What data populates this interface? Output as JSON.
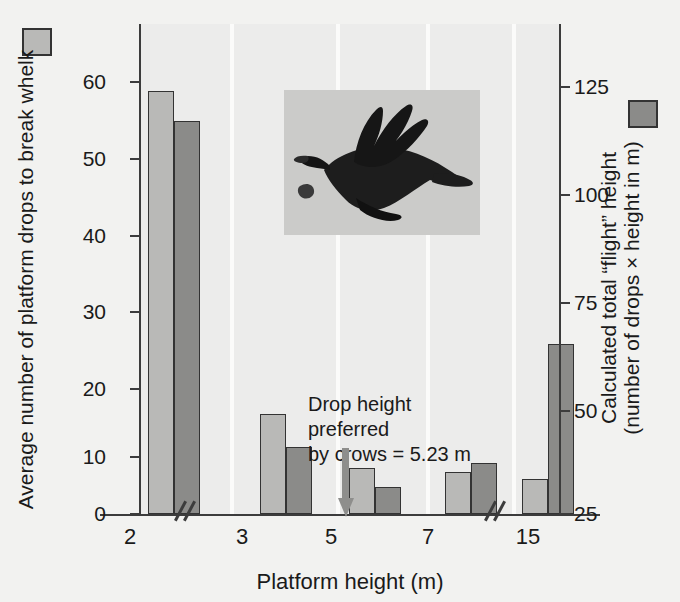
{
  "chart_data": {
    "type": "bar",
    "title": "",
    "xlabel": "Platform height (m)",
    "categories": [
      "2",
      "3",
      "5",
      "7",
      "15"
    ],
    "series": [
      {
        "name": "Average number of platform drops to break whelk",
        "axis": "left",
        "color": "#b9b9b7",
        "values": [
          55,
          13,
          6,
          5.4,
          4.5
        ]
      },
      {
        "name": "Calculated total “flight” height (number of drops × height in m)",
        "axis": "right",
        "color": "#8b8b89",
        "values": [
          51,
          8.7,
          3.5,
          6.6,
          22
        ]
      }
    ],
    "left_axis": {
      "label": "Average number of platform drops to break whelk",
      "ticks": [
        "0",
        "10",
        "20",
        "30",
        "40",
        "50",
        "60"
      ],
      "ylim": [
        0,
        64
      ]
    },
    "right_axis": {
      "label": "Calculated total “flight” height (number of drops × height in m)",
      "ticks": [
        "25",
        "50",
        "75",
        "100",
        "125"
      ],
      "ylim": [
        25,
        133
      ]
    },
    "annotation": "Drop height preferred by crows = 5.23 m",
    "annotation_lines": [
      "Drop height",
      "preferred",
      "by crows = 5.23 m"
    ],
    "axis_breaks": 2,
    "grid": false,
    "legend_position": "axis-labels"
  },
  "axes": {
    "x_title": "Platform height (m)",
    "left_title": "Average number of platform drops to break whelk",
    "right_title_line1": "Calculated total “flight” height",
    "right_title_line2": "(number of drops × height in m)",
    "left_ticks": [
      {
        "value": "0",
        "y": 514
      },
      {
        "value": "10",
        "y": 457
      },
      {
        "value": "20",
        "y": 389
      },
      {
        "value": "30",
        "y": 312
      },
      {
        "value": "40",
        "y": 236
      },
      {
        "value": "50",
        "y": 159
      },
      {
        "value": "60",
        "y": 82
      }
    ],
    "right_ticks": [
      {
        "value": "25",
        "y": 514
      },
      {
        "value": "50",
        "y": 411
      },
      {
        "value": "75",
        "y": 303
      },
      {
        "value": "100",
        "y": 195
      },
      {
        "value": "125",
        "y": 87
      }
    ],
    "categories": [
      {
        "label": "2",
        "x": 130
      },
      {
        "label": "3",
        "x": 242
      },
      {
        "label": "5",
        "x": 331
      },
      {
        "label": "7",
        "x": 428
      },
      {
        "label": "15",
        "x": 528
      }
    ]
  },
  "bars": [
    {
      "group": "2",
      "series": "light",
      "value": 55,
      "left": 8,
      "width": 26,
      "height": 423
    },
    {
      "group": "2",
      "series": "dark",
      "value": 51,
      "left": 34,
      "width": 26,
      "height": 393
    },
    {
      "group": "3",
      "series": "light",
      "value": 13,
      "left": 120,
      "width": 26,
      "height": 100
    },
    {
      "group": "3",
      "series": "dark",
      "value": 8.7,
      "left": 146,
      "width": 26,
      "height": 67
    },
    {
      "group": "5",
      "series": "light",
      "value": 6,
      "left": 209,
      "width": 26,
      "height": 46
    },
    {
      "group": "5",
      "series": "dark",
      "value": 3.5,
      "left": 235,
      "width": 26,
      "height": 27
    },
    {
      "group": "7",
      "series": "light",
      "value": 5.4,
      "left": 305,
      "width": 26,
      "height": 42
    },
    {
      "group": "7",
      "series": "dark",
      "value": 6.6,
      "left": 331,
      "width": 26,
      "height": 51
    },
    {
      "group": "15",
      "series": "light",
      "value": 4.5,
      "left": 382,
      "width": 26,
      "height": 35
    },
    {
      "group": "15",
      "series": "dark",
      "value": 22,
      "left": 408,
      "width": 26,
      "height": 170
    }
  ],
  "group_separators": [
    90,
    196,
    286,
    372
  ],
  "axis_breaks": [
    173,
    483
  ],
  "annotation": {
    "line1": "Drop height",
    "line2": "preferred",
    "line3": "by crows = 5.23 m"
  },
  "inset": {
    "caption": "crow-in-flight-dropping-whelk"
  }
}
